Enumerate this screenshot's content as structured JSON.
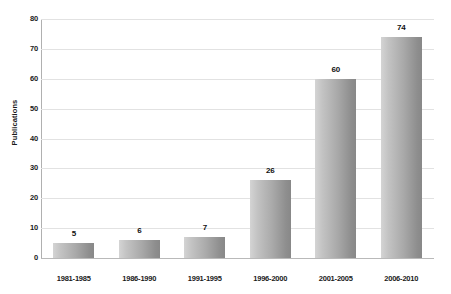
{
  "chart_data": {
    "type": "bar",
    "title": "",
    "xlabel": "",
    "ylabel": "Publications",
    "categories": [
      "1981-1985",
      "1986-1990",
      "1991-1995",
      "1996-2000",
      "2001-2005",
      "2006-2010"
    ],
    "values": [
      5,
      6,
      7,
      26,
      60,
      74
    ],
    "value_labels": [
      "5",
      "6",
      "7",
      "26",
      "60",
      "74"
    ],
    "ylim": [
      0,
      80
    ],
    "ytick_labels": [
      "0",
      "10",
      "20",
      "30",
      "40",
      "50",
      "60",
      "70",
      "80"
    ],
    "ytick_values": [
      0,
      10,
      20,
      30,
      40,
      50,
      60,
      70,
      80
    ],
    "grid": "horizontal",
    "legend": "none",
    "bar_color_light": "#d4d4d4",
    "bar_color_dark": "#888888",
    "gridline_color": "#e2e2e2",
    "axis_color": "#b0b0b0",
    "background_color": "#ffffff"
  }
}
